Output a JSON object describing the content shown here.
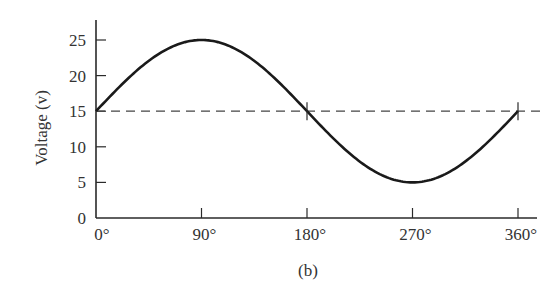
{
  "chart_data": {
    "type": "line",
    "title": "",
    "caption": "(b)",
    "xlabel": "",
    "ylabel": "Voltage (v)",
    "xlim": [
      0,
      360
    ],
    "ylim": [
      0,
      27
    ],
    "grid": false,
    "x_ticks": [
      0,
      90,
      180,
      270,
      360
    ],
    "x_tick_labels": [
      "0°",
      "90°",
      "180°",
      "270°",
      "360°"
    ],
    "y_ticks": [
      0,
      5,
      10,
      15,
      20,
      25
    ],
    "y_tick_labels": [
      "0",
      "5",
      "10",
      "15",
      "20",
      "25"
    ],
    "series": [
      {
        "name": "Voltage",
        "style": "solid",
        "description": "v = 15 + 10·sin(θ)",
        "x": [
          0,
          30,
          60,
          90,
          120,
          150,
          180,
          210,
          240,
          270,
          300,
          330,
          360
        ],
        "values": [
          15,
          20,
          23.66,
          25,
          23.66,
          20,
          15,
          10,
          6.34,
          5,
          6.34,
          10,
          15
        ]
      },
      {
        "name": "DC level",
        "style": "dashed",
        "x": [
          0,
          365
        ],
        "values": [
          15,
          15
        ]
      }
    ],
    "annotations": [
      {
        "type": "crossing-marker",
        "x": 180,
        "y": 15
      },
      {
        "type": "crossing-marker",
        "x": 360,
        "y": 15
      }
    ]
  }
}
